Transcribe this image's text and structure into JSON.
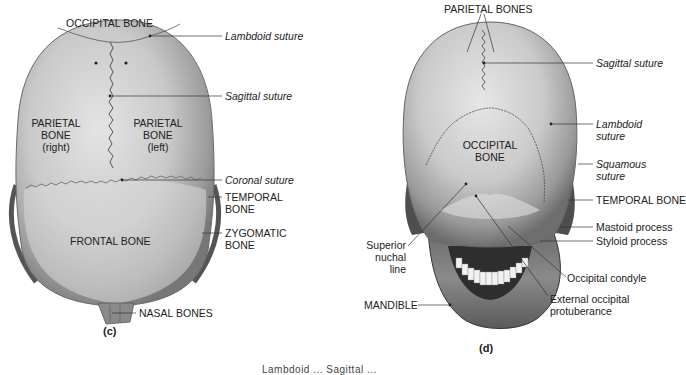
{
  "figure_c": {
    "panel_label": "(c)",
    "bone_labels": {
      "occipital": "OCCIPITAL BONE",
      "parietal_right": [
        "PARIETAL",
        "BONE",
        "(right)"
      ],
      "parietal_left": [
        "PARIETAL",
        "BONE",
        "(left)"
      ],
      "frontal": "FRONTAL BONE"
    },
    "callouts": {
      "lambdoid": "Lambdoid suture",
      "sagittal": "Sagittal suture",
      "coronal": "Coronal suture",
      "temporal": [
        "TEMPORAL",
        "BONE"
      ],
      "zygomatic": [
        "ZYGOMATIC",
        "BONE"
      ],
      "nasal": "NASAL BONES"
    }
  },
  "figure_d": {
    "panel_label": "(d)",
    "bone_labels": {
      "parietal": "PARIETAL BONES",
      "occipital": [
        "OCCIPITAL",
        "BONE"
      ]
    },
    "callouts": {
      "sagittal": "Sagittal suture",
      "lambdoid": [
        "Lambdoid",
        "suture"
      ],
      "squamous": [
        "Squamous",
        "suture"
      ],
      "temporal": "TEMPORAL BONE",
      "mastoid": "Mastoid process",
      "styloid": "Styloid process",
      "superior_nuchal": [
        "Superior",
        "nuchal",
        "line"
      ],
      "occipital_condyle": "Occipital condyle",
      "external_occipital": [
        "External occipital",
        "protuberance"
      ],
      "mandible": "MANDIBLE"
    }
  },
  "caption_fragment": "Lambdoid ... Sagittal ..."
}
